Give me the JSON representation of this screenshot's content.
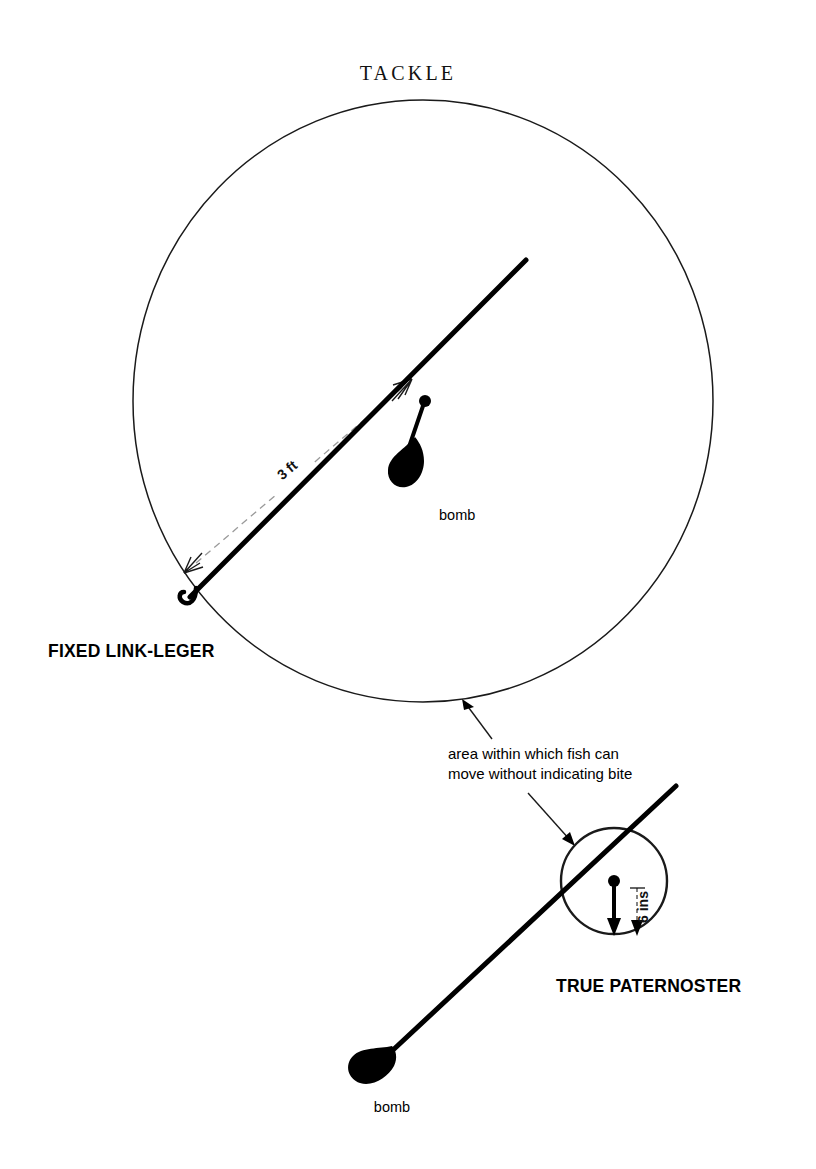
{
  "page": {
    "title": "TACKLE",
    "background_color": "#ffffff",
    "ink_color": "#000000",
    "width": 816,
    "height": 1169
  },
  "diagrams": [
    {
      "id": "fixed-link-leger",
      "heading": "FIXED LINK-LEGER",
      "bomb_label": "bomb",
      "dimension_label": "3 ft",
      "circle": {
        "cx": 423,
        "cy": 401,
        "rx": 290,
        "ry": 301
      },
      "main_line": {
        "x1": 190,
        "y1": 597,
        "x2": 526,
        "y2": 260
      },
      "junction": {
        "x": 425,
        "y": 401
      },
      "hook": {
        "x": 190,
        "y": 597
      },
      "bomb": {
        "x": 400,
        "y": 462
      }
    },
    {
      "id": "true-paternoster",
      "heading": "TRUE PATERNOSTER",
      "bomb_label": "bomb",
      "dimension_label": "6 ins",
      "circle": {
        "cx": 614,
        "cy": 881,
        "r": 53
      },
      "main_line": {
        "x1": 378,
        "y1": 1064,
        "x2": 676,
        "y2": 786
      },
      "junction": {
        "x": 614,
        "y": 881
      },
      "bomb": {
        "x": 378,
        "y": 1064
      }
    }
  ],
  "annotation": {
    "line1": "area within which fish can",
    "line2": "move without indicating bite",
    "arrow_targets": [
      "fixed-link-leger-circle",
      "true-paternoster-circle"
    ]
  }
}
